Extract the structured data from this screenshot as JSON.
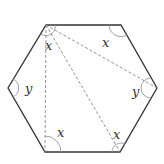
{
  "diagram": {
    "type": "regular hexagon with diagonals from one vertex",
    "colors": {
      "edge": "#333333",
      "diagonal": "#888888",
      "arc": "#999999",
      "text": "#333333"
    },
    "vertices": {
      "top_left": [
        46,
        25
      ],
      "top_right": [
        121,
        25
      ],
      "right": [
        157,
        88
      ],
      "bottom_right": [
        120,
        152
      ],
      "bottom_left": [
        45,
        152
      ],
      "left": [
        8,
        88
      ]
    },
    "labels": [
      {
        "id": "angle-top-left",
        "text": "x",
        "pos": [
          48,
          48
        ]
      },
      {
        "id": "angle-top-right",
        "text": "x",
        "pos": [
          102,
          48
        ]
      },
      {
        "id": "angle-left",
        "text": "y",
        "pos": [
          25,
          94
        ]
      },
      {
        "id": "angle-right",
        "text": "y",
        "pos": [
          132,
          97
        ]
      },
      {
        "id": "angle-bottom-left",
        "text": "x",
        "pos": [
          57,
          136
        ]
      },
      {
        "id": "angle-bottom-right",
        "text": "x",
        "pos": [
          113,
          140
        ]
      }
    ],
    "diagonals_from": "top_left",
    "diagonals_to": [
      "bottom_left",
      "bottom_right",
      "right"
    ]
  }
}
